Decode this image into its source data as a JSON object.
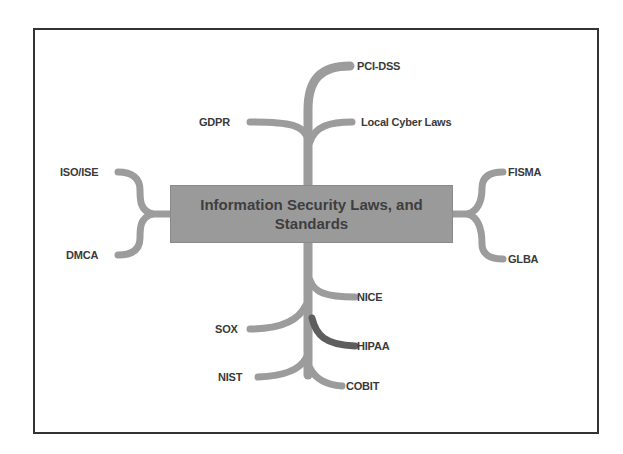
{
  "diagram": {
    "central_topic": "Information Security Laws, and Standards",
    "nodes": [
      {
        "id": "pci-dss",
        "label": "PCI-DSS",
        "side": "top"
      },
      {
        "id": "gdpr",
        "label": "GDPR",
        "side": "top"
      },
      {
        "id": "local-cyber-laws",
        "label": "Local Cyber Laws",
        "side": "top"
      },
      {
        "id": "iso-ise",
        "label": "ISO/ISE",
        "side": "left"
      },
      {
        "id": "dmca",
        "label": "DMCA",
        "side": "left"
      },
      {
        "id": "fisma",
        "label": "FISMA",
        "side": "right"
      },
      {
        "id": "glba",
        "label": "GLBA",
        "side": "right"
      },
      {
        "id": "nice",
        "label": "NICE",
        "side": "bottom"
      },
      {
        "id": "sox",
        "label": "SOX",
        "side": "bottom"
      },
      {
        "id": "hipaa",
        "label": "HIPAA",
        "side": "bottom"
      },
      {
        "id": "nist",
        "label": "NIST",
        "side": "bottom"
      },
      {
        "id": "cobit",
        "label": "COBIT",
        "side": "bottom"
      }
    ],
    "colors": {
      "branch": "#9c9c9c",
      "branch_highlight": "#5e5e5e",
      "central_fill": "#9a9a9a",
      "text": "#3a3a3a",
      "frame": "#333333"
    }
  }
}
